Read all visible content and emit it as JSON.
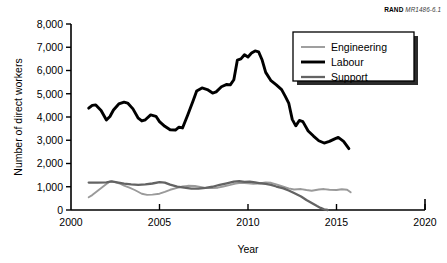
{
  "source_tag": {
    "mark": "RAND",
    "number": "MR1486-6.1"
  },
  "chart_data": {
    "type": "line",
    "title": "",
    "xlabel": "Year",
    "ylabel": "Number of direct workers",
    "xlim": [
      2000,
      2020
    ],
    "ylim": [
      0,
      8000
    ],
    "xticks": [
      2000,
      2005,
      2010,
      2015,
      2020
    ],
    "xtick_labels": [
      "2000",
      "2005",
      "2010",
      "2015",
      "2020"
    ],
    "yticks": [
      0,
      1000,
      2000,
      3000,
      4000,
      5000,
      6000,
      7000,
      8000
    ],
    "ytick_labels": [
      "0",
      "1,000",
      "2,000",
      "3,000",
      "4,000",
      "5,000",
      "6,000",
      "7,000",
      "8,000"
    ],
    "grid": false,
    "legend_position": "top-right",
    "series": [
      {
        "name": "Engineering",
        "color": "#9a9a9a",
        "width": 1.9,
        "x": [
          2001.0,
          2001.2,
          2001.4,
          2001.6,
          2001.8,
          2002.0,
          2002.2,
          2002.5,
          2002.8,
          2003.0,
          2003.3,
          2003.6,
          2004.0,
          2004.3,
          2004.6,
          2005.0,
          2005.3,
          2005.6,
          2006.0,
          2006.3,
          2006.6,
          2007.0,
          2007.3,
          2007.6,
          2008.0,
          2008.3,
          2008.6,
          2009.0,
          2009.3,
          2009.6,
          2010.0,
          2010.3,
          2010.6,
          2011.0,
          2011.3,
          2011.6,
          2012.0,
          2012.3,
          2012.6,
          2013.0,
          2013.3,
          2013.6,
          2014.0,
          2014.3,
          2014.6,
          2015.0,
          2015.3,
          2015.6,
          2015.8
        ],
        "y": [
          550,
          640,
          760,
          880,
          1000,
          1120,
          1230,
          1200,
          1120,
          1050,
          960,
          860,
          700,
          650,
          660,
          700,
          780,
          870,
          950,
          1010,
          1040,
          1030,
          990,
          950,
          940,
          960,
          1010,
          1080,
          1140,
          1170,
          1150,
          1130,
          1140,
          1190,
          1170,
          1100,
          1000,
          930,
          880,
          900,
          860,
          830,
          880,
          900,
          870,
          860,
          890,
          870,
          760
        ]
      },
      {
        "name": "Labour",
        "color": "#000000",
        "width": 2.9,
        "x": [
          2001.0,
          2001.2,
          2001.4,
          2001.7,
          2002.0,
          2002.2,
          2002.4,
          2002.7,
          2003.0,
          2003.2,
          2003.5,
          2003.8,
          2004.0,
          2004.2,
          2004.5,
          2004.8,
          2005.0,
          2005.3,
          2005.6,
          2005.9,
          2006.1,
          2006.3,
          2006.6,
          2006.9,
          2007.1,
          2007.4,
          2007.7,
          2008.0,
          2008.2,
          2008.5,
          2008.8,
          2009.0,
          2009.2,
          2009.4,
          2009.6,
          2009.8,
          2010.0,
          2010.2,
          2010.4,
          2010.6,
          2010.8,
          2011.0,
          2011.3,
          2011.6,
          2011.9,
          2012.1,
          2012.3,
          2012.5,
          2012.7,
          2012.9,
          2013.1,
          2013.4,
          2013.7,
          2014.0,
          2014.3,
          2014.6,
          2014.9,
          2015.1,
          2015.4,
          2015.7
        ],
        "y": [
          4380,
          4500,
          4520,
          4280,
          3870,
          4020,
          4300,
          4560,
          4640,
          4600,
          4350,
          3950,
          3830,
          3880,
          4090,
          4030,
          3800,
          3600,
          3450,
          3440,
          3560,
          3530,
          4100,
          4700,
          5120,
          5250,
          5180,
          5030,
          5080,
          5300,
          5400,
          5380,
          5600,
          6450,
          6500,
          6680,
          6580,
          6750,
          6840,
          6800,
          6450,
          5920,
          5560,
          5380,
          5180,
          4900,
          4600,
          3900,
          3620,
          3850,
          3800,
          3400,
          3180,
          2980,
          2880,
          2950,
          3060,
          3120,
          2950,
          2640
        ]
      },
      {
        "name": "Support",
        "color": "#636363",
        "width": 2.3,
        "x": [
          2001.0,
          2001.5,
          2002.0,
          2002.3,
          2002.6,
          2003.0,
          2003.4,
          2003.8,
          2004.2,
          2004.6,
          2005.0,
          2005.3,
          2005.6,
          2006.0,
          2006.4,
          2006.8,
          2007.2,
          2007.6,
          2008.0,
          2008.4,
          2008.8,
          2009.2,
          2009.5,
          2009.8,
          2010.1,
          2010.4,
          2010.7,
          2011.0,
          2011.3,
          2011.6,
          2012.0,
          2012.3,
          2012.6,
          2013.0,
          2013.3,
          2013.6,
          2013.9,
          2014.1,
          2014.3,
          2014.5
        ],
        "y": [
          1180,
          1180,
          1190,
          1230,
          1190,
          1130,
          1100,
          1080,
          1100,
          1140,
          1200,
          1180,
          1090,
          1010,
          960,
          920,
          920,
          950,
          1000,
          1080,
          1150,
          1220,
          1240,
          1210,
          1220,
          1190,
          1150,
          1120,
          1080,
          1010,
          930,
          840,
          730,
          580,
          430,
          300,
          170,
          90,
          30,
          0
        ]
      }
    ]
  }
}
